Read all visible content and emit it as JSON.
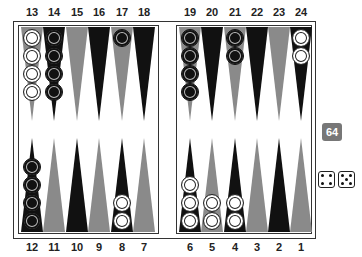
{
  "game": "backgammon",
  "colors": {
    "black_point": "#111111",
    "gray_point": "#8a8a8a",
    "white_checker": "#ffffff",
    "black_checker": "#111111",
    "cube": "#777777"
  },
  "top_labels": [
    "13",
    "14",
    "15",
    "16",
    "17",
    "18",
    "19",
    "20",
    "21",
    "22",
    "23",
    "24"
  ],
  "bottom_labels": [
    "12",
    "11",
    "10",
    "9",
    "8",
    "7",
    "6",
    "5",
    "4",
    "3",
    "2",
    "1"
  ],
  "top_points": [
    {
      "num": "13",
      "color": "gray",
      "checkers": 4,
      "player": "white"
    },
    {
      "num": "14",
      "color": "black",
      "checkers": 4,
      "player": "black"
    },
    {
      "num": "15",
      "color": "gray",
      "checkers": 0,
      "player": ""
    },
    {
      "num": "16",
      "color": "black",
      "checkers": 0,
      "player": ""
    },
    {
      "num": "17",
      "color": "gray",
      "checkers": 1,
      "player": "black"
    },
    {
      "num": "18",
      "color": "black",
      "checkers": 0,
      "player": ""
    },
    {
      "num": "19",
      "color": "gray",
      "checkers": 4,
      "player": "black"
    },
    {
      "num": "20",
      "color": "black",
      "checkers": 0,
      "player": ""
    },
    {
      "num": "21",
      "color": "gray",
      "checkers": 2,
      "player": "black"
    },
    {
      "num": "22",
      "color": "black",
      "checkers": 0,
      "player": ""
    },
    {
      "num": "23",
      "color": "gray",
      "checkers": 0,
      "player": ""
    },
    {
      "num": "24",
      "color": "black",
      "checkers": 2,
      "player": "white"
    }
  ],
  "bottom_points": [
    {
      "num": "12",
      "color": "black",
      "checkers": 4,
      "player": "black"
    },
    {
      "num": "11",
      "color": "gray",
      "checkers": 0,
      "player": ""
    },
    {
      "num": "10",
      "color": "black",
      "checkers": 0,
      "player": ""
    },
    {
      "num": "9",
      "color": "gray",
      "checkers": 0,
      "player": ""
    },
    {
      "num": "8",
      "color": "black",
      "checkers": 2,
      "player": "white"
    },
    {
      "num": "7",
      "color": "gray",
      "checkers": 0,
      "player": ""
    },
    {
      "num": "6",
      "color": "black",
      "checkers": 3,
      "player": "white"
    },
    {
      "num": "5",
      "color": "gray",
      "checkers": 2,
      "player": "white"
    },
    {
      "num": "4",
      "color": "black",
      "checkers": 2,
      "player": "white"
    },
    {
      "num": "3",
      "color": "gray",
      "checkers": 0,
      "player": ""
    },
    {
      "num": "2",
      "color": "black",
      "checkers": 0,
      "player": ""
    },
    {
      "num": "1",
      "color": "gray",
      "checkers": 0,
      "player": ""
    }
  ],
  "doubling_cube": {
    "value": "64"
  },
  "dice": [
    4,
    5
  ]
}
